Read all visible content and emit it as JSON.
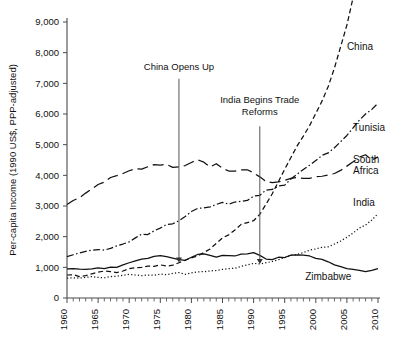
{
  "chart_data": {
    "type": "line",
    "title": "",
    "xlabel": "",
    "ylabel": "Per-capita Income (1990 US$, PPP-adjusted)",
    "xlim": [
      1960,
      2010
    ],
    "ylim": [
      0,
      9000
    ],
    "grid": false,
    "legend_position": "inline-right-labels",
    "y_ticks": [
      "0",
      "1,000",
      "2,000",
      "3,000",
      "4,000",
      "5,000",
      "6,000",
      "7,000",
      "8,000",
      "9,000"
    ],
    "y_tick_values": [
      0,
      1000,
      2000,
      3000,
      4000,
      5000,
      6000,
      7000,
      8000,
      9000
    ],
    "x_ticks": [
      "1960",
      "1965",
      "1970",
      "1975",
      "1980",
      "1985",
      "1990",
      "1995",
      "2000",
      "2005",
      "2010"
    ],
    "x_tick_values": [
      1960,
      1965,
      1970,
      1975,
      1980,
      1985,
      1990,
      1995,
      2000,
      2005,
      2010
    ],
    "x_minor_step": 1,
    "x": [
      1960,
      1961,
      1962,
      1963,
      1964,
      1965,
      1966,
      1967,
      1968,
      1969,
      1970,
      1971,
      1972,
      1973,
      1974,
      1975,
      1976,
      1977,
      1978,
      1979,
      1980,
      1981,
      1982,
      1983,
      1984,
      1985,
      1986,
      1987,
      1988,
      1989,
      1990,
      1991,
      1992,
      1993,
      1994,
      1995,
      1996,
      1997,
      1998,
      1999,
      2000,
      2001,
      2002,
      2003,
      2004,
      2005,
      2006,
      2007,
      2008,
      2009,
      2010
    ],
    "series": [
      {
        "name": "China",
        "label": "China",
        "style": "dashed",
        "dash": "5,3",
        "values": [
          750,
          760,
          700,
          730,
          790,
          840,
          880,
          860,
          830,
          880,
          960,
          990,
          1000,
          1040,
          1030,
          1080,
          1040,
          1070,
          1150,
          1230,
          1310,
          1370,
          1480,
          1600,
          1780,
          1960,
          2060,
          2220,
          2400,
          2460,
          2520,
          2730,
          3060,
          3400,
          3800,
          4200,
          4580,
          4960,
          5280,
          5620,
          6020,
          6420,
          6900,
          7500,
          8200,
          8900,
          9800,
          10800,
          11700,
          12600,
          13800
        ],
        "label_x": 2005,
        "label_y": 8100,
        "end_value_visible": 8000
      },
      {
        "name": "Tunisia",
        "label": "Tunisia",
        "style": "dash-dot",
        "dash": "7,2.5,1.5,2.5",
        "values": [
          1350,
          1410,
          1470,
          1520,
          1560,
          1580,
          1560,
          1620,
          1700,
          1760,
          1830,
          1960,
          2080,
          2070,
          2190,
          2280,
          2400,
          2420,
          2520,
          2660,
          2820,
          2920,
          2940,
          2970,
          3050,
          3120,
          3060,
          3130,
          3150,
          3180,
          3320,
          3350,
          3520,
          3540,
          3650,
          3680,
          3880,
          4040,
          4190,
          4330,
          4480,
          4650,
          4730,
          4900,
          5100,
          5300,
          5550,
          5800,
          6000,
          6150,
          6350
        ],
        "label_x": 2006,
        "label_y": 5450,
        "end_value_visible": 6350
      },
      {
        "name": "South Africa",
        "label": "South Africa",
        "style": "long-dash",
        "dash": "11,5",
        "values": [
          3050,
          3180,
          3270,
          3420,
          3560,
          3700,
          3780,
          3930,
          3990,
          4060,
          4150,
          4220,
          4200,
          4280,
          4350,
          4330,
          4360,
          4260,
          4280,
          4320,
          4420,
          4510,
          4430,
          4270,
          4380,
          4230,
          4140,
          4140,
          4180,
          4180,
          4080,
          3950,
          3800,
          3760,
          3790,
          3840,
          3900,
          3930,
          3900,
          3900,
          3960,
          3970,
          4010,
          4060,
          4160,
          4300,
          4440,
          4590,
          4670,
          4500,
          4600
        ],
        "label_x": 2006,
        "label_y": 4400,
        "end_value_visible": 4600
      },
      {
        "name": "India",
        "label": "India",
        "style": "dotted",
        "dash": "1.2,2.2",
        "values": [
          650,
          660,
          650,
          670,
          700,
          670,
          660,
          700,
          710,
          740,
          770,
          750,
          730,
          750,
          740,
          780,
          760,
          800,
          830,
          770,
          820,
          850,
          860,
          880,
          900,
          930,
          960,
          970,
          1030,
          1080,
          1130,
          1110,
          1150,
          1190,
          1250,
          1320,
          1390,
          1420,
          1480,
          1560,
          1600,
          1650,
          1670,
          1760,
          1860,
          1980,
          2120,
          2280,
          2380,
          2540,
          2750
        ],
        "label_x": 2006,
        "label_y": 3000,
        "end_value_visible": 2750
      },
      {
        "name": "Zimbabwe",
        "label": "Zimbabwe",
        "style": "solid",
        "dash": "",
        "values": [
          950,
          960,
          940,
          930,
          950,
          980,
          960,
          1010,
          1000,
          1080,
          1150,
          1210,
          1270,
          1290,
          1360,
          1380,
          1350,
          1300,
          1250,
          1230,
          1330,
          1420,
          1440,
          1390,
          1330,
          1390,
          1380,
          1370,
          1430,
          1440,
          1480,
          1390,
          1270,
          1250,
          1330,
          1320,
          1400,
          1410,
          1400,
          1370,
          1290,
          1260,
          1180,
          1080,
          1020,
          960,
          930,
          900,
          860,
          900,
          960
        ],
        "label_x": 2002,
        "label_y": 600,
        "end_value_visible": 960
      }
    ],
    "annotations": [
      {
        "id": "china-opens-up",
        "text": "China Opens Up",
        "text_lines": [
          "China Opens Up"
        ],
        "x_value": 1978,
        "text_y_value": 7450,
        "arrow_from_y": 7150,
        "arrow_to_y": 1250
      },
      {
        "id": "india-begins-trade-reforms",
        "text": "India Begins Trade Reforms",
        "text_lines": [
          "India Begins Trade",
          "Reforms"
        ],
        "x_value": 1991,
        "text_y_value": 6350,
        "arrow_from_y": 5600,
        "arrow_to_y": 1200
      }
    ]
  }
}
